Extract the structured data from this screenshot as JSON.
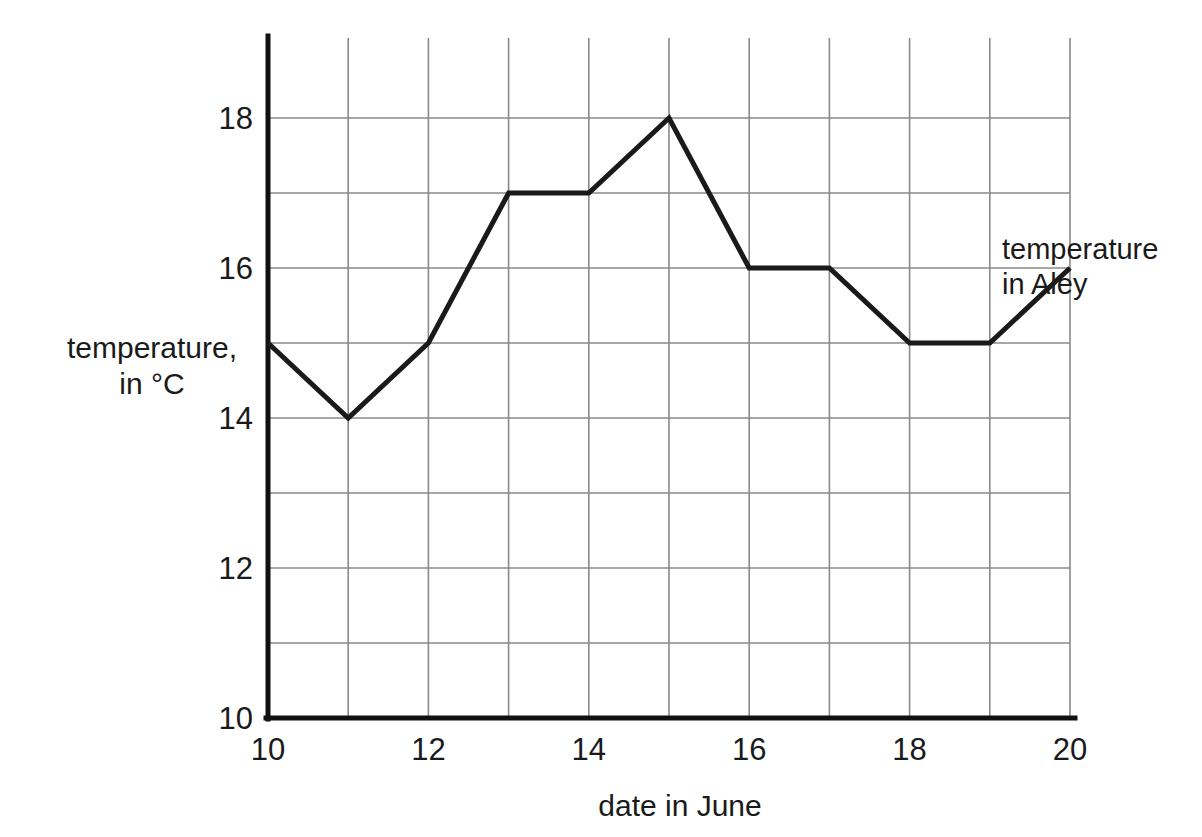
{
  "chart_data": {
    "type": "line",
    "title": "",
    "xlabel": "date in June",
    "ylabel": "temperature, in °C",
    "ylabel_line1": "temperature,",
    "ylabel_line2": "in °C",
    "series_label_line1": "temperature",
    "series_label_line2": "in Aley",
    "series": [
      {
        "name": "temperature in Aley",
        "values": [
          15,
          14,
          15,
          17,
          17,
          18,
          16,
          16,
          15,
          15,
          16
        ]
      }
    ],
    "x": [
      10,
      11,
      12,
      13,
      14,
      15,
      16,
      17,
      18,
      19,
      20
    ],
    "categories": [
      "10",
      "11",
      "12",
      "13",
      "14",
      "15",
      "16",
      "17",
      "18",
      "19",
      "20"
    ],
    "xlim": [
      10,
      20
    ],
    "ylim": [
      10,
      19
    ],
    "xticks": [
      10,
      12,
      14,
      16,
      18,
      20
    ],
    "xtick_labels": [
      "10",
      "12",
      "14",
      "16",
      "18",
      "20"
    ],
    "yticks": [
      10,
      12,
      14,
      16,
      18
    ],
    "ytick_labels": [
      "10",
      "12",
      "14",
      "16",
      "18"
    ],
    "x_gridlines": [
      10,
      11,
      12,
      13,
      14,
      15,
      16,
      17,
      18,
      19,
      20
    ],
    "y_gridlines": [
      11,
      12,
      13,
      14,
      15,
      16,
      17,
      18
    ],
    "grid": true,
    "legend_position": "right-inline",
    "colors": {
      "line": "#1a1a1a",
      "grid": "#8a8a8a",
      "axis": "#111111",
      "background": "#ffffff",
      "text": "#1a1a1a"
    },
    "annotations": []
  }
}
